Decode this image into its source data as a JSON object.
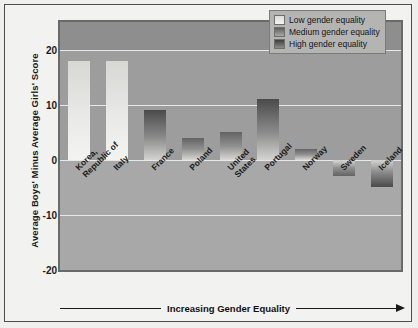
{
  "chart_data": {
    "type": "bar",
    "title": "",
    "xlabel": "Increasing Gender Equality",
    "ylabel": "Average Boys' Minus Average Girls' Score",
    "ylim": [
      -20,
      25
    ],
    "yticks": [
      20,
      10,
      0,
      -10,
      -20
    ],
    "ytick_labels": [
      "20",
      "10",
      "0",
      "-10",
      "-20"
    ],
    "grid": true,
    "legend_position": "top-right",
    "categories": [
      "Korea, Republic of",
      "Italy",
      "France",
      "Poland",
      "United States",
      "Portugal",
      "Norway",
      "Sweden",
      "Iceland"
    ],
    "values": [
      18,
      18,
      9,
      4,
      5,
      11,
      2,
      -3,
      -5
    ],
    "groups": [
      "low",
      "low",
      "high",
      "medium",
      "medium",
      "high",
      "medium",
      "medium",
      "high"
    ],
    "series": [
      {
        "name": "Low gender equality",
        "key": "low",
        "points": [
          {
            "category": "Korea, Republic of",
            "value": 18
          },
          {
            "category": "Italy",
            "value": 18
          }
        ]
      },
      {
        "name": "Medium gender equality",
        "key": "medium",
        "points": [
          {
            "category": "Poland",
            "value": 4
          },
          {
            "category": "United States",
            "value": 5
          },
          {
            "category": "Norway",
            "value": 2
          },
          {
            "category": "Sweden",
            "value": -3
          }
        ]
      },
      {
        "name": "High gender equality",
        "key": "high",
        "points": [
          {
            "category": "France",
            "value": 9
          },
          {
            "category": "Portugal",
            "value": 11
          },
          {
            "category": "Iceland",
            "value": -5
          }
        ]
      }
    ]
  },
  "axis": {
    "y_title": "Average Boys' Minus Average Girls' Score",
    "ticks": [
      {
        "label": "20",
        "value": 20
      },
      {
        "label": "10",
        "value": 10
      },
      {
        "label": "0",
        "value": 0
      },
      {
        "label": "-10",
        "value": -10
      },
      {
        "label": "-20",
        "value": -20
      }
    ]
  },
  "bars": [
    {
      "label_line1": "Korea,",
      "label_line2": "Republic of",
      "value": 18,
      "group": "low"
    },
    {
      "label_line1": "Italy",
      "label_line2": "",
      "value": 18,
      "group": "low"
    },
    {
      "label_line1": "France",
      "label_line2": "",
      "value": 9,
      "group": "high"
    },
    {
      "label_line1": "Poland",
      "label_line2": "",
      "value": 4,
      "group": "medium"
    },
    {
      "label_line1": "United",
      "label_line2": "States",
      "value": 5,
      "group": "medium"
    },
    {
      "label_line1": "Portugal",
      "label_line2": "",
      "value": 11,
      "group": "high"
    },
    {
      "label_line1": "Norway",
      "label_line2": "",
      "value": 2,
      "group": "medium"
    },
    {
      "label_line1": "Sweden",
      "label_line2": "",
      "value": -3,
      "group": "medium"
    },
    {
      "label_line1": "Iceland",
      "label_line2": "",
      "value": -5,
      "group": "high"
    }
  ],
  "legend": {
    "items": [
      {
        "label": "Low gender equality",
        "key": "low"
      },
      {
        "label": "Medium gender equality",
        "key": "medium"
      },
      {
        "label": "High gender equality",
        "key": "high"
      }
    ]
  },
  "footer": {
    "arrow_caption": "Increasing Gender Equality"
  },
  "colors": {
    "plot_background": "#9d9d9d",
    "plot_border": "#6a6a6a",
    "page_background": "#f2f2f0",
    "gridline": "#e8e8e6",
    "text": "#1a1a1a",
    "legend_background": "#b4b4b2",
    "bar_low": "#e9e9e7",
    "bar_medium": "#8f8f8f",
    "bar_high": "#6a6a6a"
  }
}
